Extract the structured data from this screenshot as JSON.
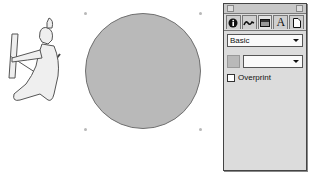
{
  "canvas": {
    "circle": {
      "fill": "#b9b9b9",
      "stroke": "#707070"
    },
    "figure": {
      "description": "kneeling archer with bow"
    }
  },
  "panel": {
    "tabs": [
      {
        "icon": "info-icon",
        "glyph": "i"
      },
      {
        "icon": "stroke-icon",
        "glyph": "~"
      },
      {
        "icon": "fill-icon",
        "glyph": "▬"
      },
      {
        "icon": "text-icon",
        "glyph": "A"
      },
      {
        "icon": "document-icon",
        "glyph": "▯"
      }
    ],
    "active_tab": 2,
    "fill_type": "Basic",
    "color_value": "",
    "color_swatch": "#b9b9b9",
    "overprint_label": "Overprint",
    "overprint_checked": false
  }
}
